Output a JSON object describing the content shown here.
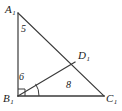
{
  "figure": {
    "background_color": "#ffffff",
    "stroke_color": "#3a3a3a",
    "text_color": "#1b1b1b",
    "vertices": [
      {
        "id": "A1",
        "letter": "A",
        "subscript": "1",
        "x": 18,
        "y": 13,
        "label_x": 5,
        "label_y": 4
      },
      {
        "id": "B1",
        "letter": "B",
        "subscript": "1",
        "x": 18,
        "y": 96,
        "label_x": 3,
        "label_y": 93
      },
      {
        "id": "C1",
        "letter": "C",
        "subscript": "1",
        "x": 104,
        "y": 96,
        "label_x": 106,
        "label_y": 93
      },
      {
        "id": "D1",
        "letter": "D",
        "subscript": "1",
        "x": 75,
        "y": 62,
        "label_x": 78,
        "label_y": 50
      }
    ],
    "segments": [
      {
        "id": "A1B1",
        "from": "A1",
        "to": "B1"
      },
      {
        "id": "A1C1",
        "from": "A1",
        "to": "C1"
      },
      {
        "id": "B1C1",
        "from": "B1",
        "to": "C1"
      },
      {
        "id": "B1D1",
        "from": "B1",
        "to": "D1"
      }
    ],
    "length_labels": [
      {
        "id": "len-A1B1",
        "value": "5",
        "x": 21,
        "y": 24,
        "segment": "A1B1"
      },
      {
        "id": "len-B1D1",
        "value": "6",
        "x": 19,
        "y": 72,
        "segment": "B1D1"
      },
      {
        "id": "len-D1C1-base",
        "value": "8",
        "x": 66,
        "y": 80,
        "segment": "B1C1"
      }
    ],
    "markers": [
      {
        "id": "right-angle-B1",
        "type": "right-angle-square",
        "at": "B1"
      },
      {
        "id": "angle-arc-D1B1C1",
        "type": "angle-arc",
        "at": "B1"
      }
    ]
  }
}
